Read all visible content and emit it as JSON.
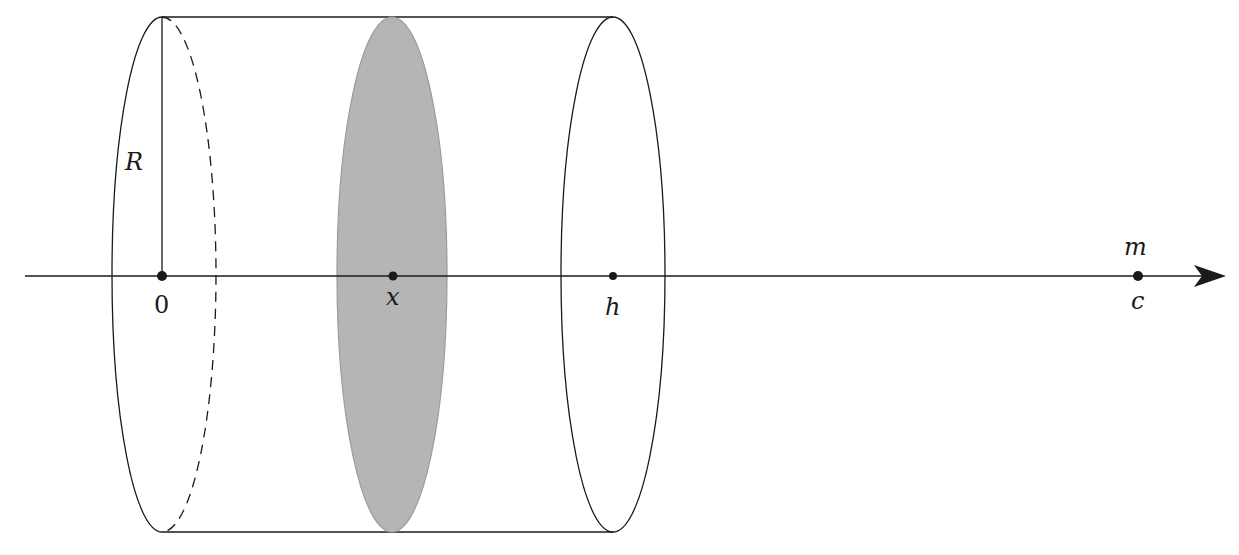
{
  "diagram": {
    "colors": {
      "stroke": "#1a1a1a",
      "disk_fill": "#b5b5b5",
      "disk_stroke": "#9a9a9a",
      "background": "#ffffff"
    },
    "labels": {
      "radius": "R",
      "origin": "0",
      "slice_position": "x",
      "cylinder_end": "h",
      "mass": "m",
      "mass_position": "c"
    },
    "axis": {
      "direction": "right",
      "points": [
        {
          "name": "origin",
          "label": "0"
        },
        {
          "name": "slice",
          "label": "x"
        },
        {
          "name": "end",
          "label": "h"
        },
        {
          "name": "mass",
          "label": "c"
        }
      ]
    }
  }
}
